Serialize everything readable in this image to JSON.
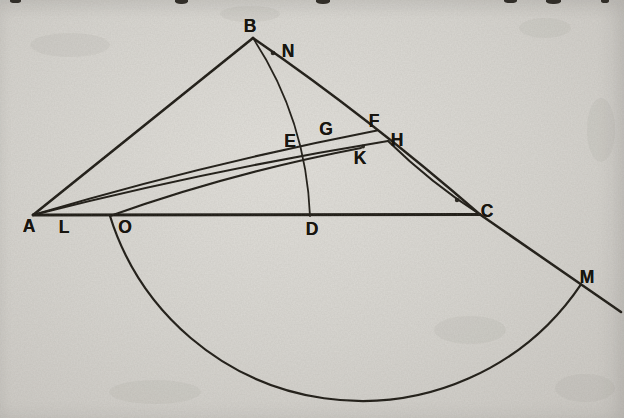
{
  "page": {
    "kind": "scanned geometry textbook figure",
    "paper_color": "#d8d6d1",
    "ink_color": "#1c1913"
  },
  "figure": {
    "viewbox": "0 0 624 418",
    "point_labels": [
      {
        "id": "A",
        "text": "A",
        "x": 29,
        "y": 226
      },
      {
        "id": "B",
        "text": "B",
        "x": 250,
        "y": 26
      },
      {
        "id": "C",
        "text": "C",
        "x": 487,
        "y": 211
      },
      {
        "id": "D",
        "text": "D",
        "x": 312,
        "y": 229
      },
      {
        "id": "E",
        "text": "E",
        "x": 290,
        "y": 141
      },
      {
        "id": "F",
        "text": "F",
        "x": 374,
        "y": 121
      },
      {
        "id": "G",
        "text": "G",
        "x": 326,
        "y": 129
      },
      {
        "id": "H",
        "text": "H",
        "x": 397,
        "y": 140
      },
      {
        "id": "K",
        "text": "K",
        "x": 360,
        "y": 158
      },
      {
        "id": "L",
        "text": "L",
        "x": 64,
        "y": 227
      },
      {
        "id": "M",
        "text": "M",
        "x": 587,
        "y": 277
      },
      {
        "id": "N",
        "text": "N",
        "x": 288,
        "y": 51
      },
      {
        "id": "O",
        "text": "O",
        "x": 125,
        "y": 227
      }
    ],
    "strokes": [
      {
        "name": "side-A-B",
        "d": "M 33 215 L 253 38",
        "w": 2.6
      },
      {
        "name": "side-B-C",
        "d": "M 253 38 Q 368 117 480 214.5",
        "w": 2.5
      },
      {
        "name": "extension-C-to-M",
        "d": "M 480 214.5 L 621 312",
        "w": 2.5
      },
      {
        "name": "base-A-C",
        "d": "M 33 215 L 480 214.5",
        "w": 2.8
      },
      {
        "name": "line-A-F",
        "d": "M 33 215 Q 200 165 377 130.5",
        "w": 2
      },
      {
        "name": "line-A-H",
        "d": "M 33 215 Q 205 171 388 141",
        "w": 2
      },
      {
        "name": "line-O-K",
        "d": "M 110 216 Q 230 173 361 148",
        "w": 2
      },
      {
        "name": "line-H-C",
        "d": "M 388 141 Q 431 183 480 214.5",
        "w": 2
      },
      {
        "name": "compass-arc-N-D",
        "d": "M 253 38 A 350 350 0 0 1 310 216",
        "w": 1.8
      },
      {
        "name": "compass-arc-O-M",
        "d": "M 110 216 A 264 264 0 0 0 581 284.3",
        "w": 2.2
      }
    ],
    "ink_dots": [
      {
        "name": "point-N-dot",
        "x": 273,
        "y": 53,
        "r": 2.3
      },
      {
        "name": "ink-blob-K",
        "x": 363,
        "y": 146.5,
        "r": 2.0
      },
      {
        "name": "ink-blob-near-C",
        "x": 457,
        "y": 200,
        "r": 2.2
      }
    ]
  },
  "artifacts": {
    "top_edge_glyph_fragments": [
      {
        "x": 10,
        "w": 11,
        "h": 3
      },
      {
        "x": 175,
        "w": 13,
        "h": 4
      },
      {
        "x": 316,
        "w": 14,
        "h": 4
      },
      {
        "x": 504,
        "w": 13,
        "h": 3
      },
      {
        "x": 546,
        "w": 15,
        "h": 4
      },
      {
        "x": 601,
        "w": 8,
        "h": 3
      }
    ],
    "paper_smudges": [
      {
        "x": 70,
        "y": 45,
        "rx": 40,
        "ry": 12
      },
      {
        "x": 250,
        "y": 14,
        "rx": 30,
        "ry": 8
      },
      {
        "x": 545,
        "y": 28,
        "rx": 26,
        "ry": 10
      },
      {
        "x": 470,
        "y": 330,
        "rx": 36,
        "ry": 14
      },
      {
        "x": 155,
        "y": 392,
        "rx": 46,
        "ry": 12
      },
      {
        "x": 601,
        "y": 130,
        "rx": 14,
        "ry": 32
      },
      {
        "x": 585,
        "y": 388,
        "rx": 30,
        "ry": 14
      }
    ]
  }
}
